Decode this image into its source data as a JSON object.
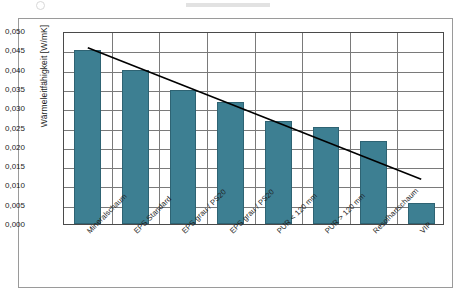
{
  "figure": {
    "frame_border_color": "#9a9a9a",
    "background": "#ffffff"
  },
  "chart_data": {
    "type": "bar",
    "title": "",
    "subtitle": "",
    "xlabel": "",
    "ylabel": "Wärmeleitfähigkeit [W/mK]",
    "ylim": [
      0.0,
      0.05
    ],
    "ytick_step": 0.005,
    "ytick_labels": [
      "0,000",
      "0,005",
      "0,010",
      "0,015",
      "0,020",
      "0,025",
      "0,030",
      "0,035",
      "0,040",
      "0,045",
      "0,050"
    ],
    "ytick_values": [
      0.0,
      0.005,
      0.01,
      0.015,
      0.02,
      0.025,
      0.03,
      0.035,
      0.04,
      0.045,
      0.05
    ],
    "grid": "horizontal-and-vertical",
    "legend": "none",
    "decimal_separator": ",",
    "categories": [
      "Mineralschaum",
      "EPS Standard",
      "EPS grau / PS20",
      "EPS grau / PS20",
      "PUR < 120 mm",
      "PUR > 120 mm",
      "Resolhartschaum",
      "VIP"
    ],
    "values": [
      0.045,
      0.0399,
      0.0348,
      0.0315,
      0.0266,
      0.0251,
      0.0215,
      0.0055
    ],
    "bar_color": "#3d7f92",
    "bar_edge_color": "#2e6373",
    "annotations": [
      {
        "name": "trendline",
        "type": "line",
        "color": "#000000",
        "x_start_category": "Mineralschaum",
        "x_end_category": "VIP",
        "y_start": 0.0462,
        "y_end": 0.0121
      }
    ]
  }
}
